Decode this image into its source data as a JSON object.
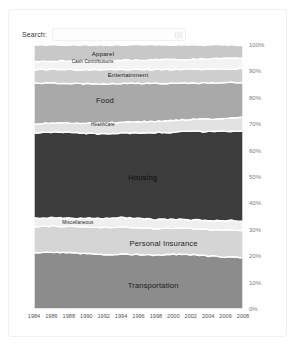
{
  "search": {
    "label": "Search:",
    "value": "",
    "placeholder": "",
    "clear_icon": "clear-icon"
  },
  "chart_data": {
    "type": "area",
    "title": "",
    "subtitle": "",
    "xlabel": "",
    "ylabel": "",
    "stacked": "100%",
    "grid": false,
    "legend_position": "inline-labels",
    "x": [
      1984,
      1986,
      1988,
      1990,
      1992,
      1994,
      1996,
      1998,
      2000,
      2002,
      2004,
      2006,
      2008
    ],
    "xtick_labels": [
      "1984",
      "1986",
      "1988",
      "1990",
      "1992",
      "1994",
      "1996",
      "1998",
      "2000",
      "2002",
      "2004",
      "2006",
      "2008"
    ],
    "ytick_labels": [
      "100%",
      "90%",
      "80%",
      "70%",
      "60%",
      "50%",
      "40%",
      "30%",
      "20%",
      "10%",
      "0%"
    ],
    "ylim": [
      0,
      100
    ],
    "series": [
      {
        "name": "Transportation",
        "color": "#8c8c8c",
        "label_x_pct": 57,
        "label_y_pct": 9,
        "values": [
          20.3,
          20.8,
          20.6,
          20.0,
          19.4,
          19.8,
          19.6,
          19.4,
          19.8,
          19.8,
          19.3,
          19.0,
          18.8
        ]
      },
      {
        "name": "Personal Insurance",
        "color": "#d5d5d5",
        "label_x_pct": 62,
        "label_y_pct": 25,
        "values": [
          9.8,
          9.6,
          9.6,
          9.6,
          9.9,
          9.8,
          9.7,
          9.6,
          9.4,
          9.4,
          9.6,
          9.8,
          10.0
        ]
      },
      {
        "name": "Miscellaneous",
        "color": "#efefef",
        "label_x_pct": 21,
        "label_y_pct": 33,
        "values": [
          3.0,
          3.1,
          3.1,
          3.2,
          3.3,
          3.4,
          3.4,
          3.3,
          3.2,
          3.2,
          3.3,
          3.4,
          3.5
        ]
      },
      {
        "name": "Housing",
        "color": "#3c3c3c",
        "label_x_pct": 52,
        "label_y_pct": 50,
        "values": [
          31.0,
          31.5,
          31.2,
          30.7,
          30.3,
          30.4,
          30.8,
          31.4,
          31.6,
          32.2,
          32.3,
          32.6,
          32.8
        ]
      },
      {
        "name": "Healthcare",
        "color": "#e2e2e2",
        "label_x_pct": 33,
        "label_y_pct": 70,
        "values": [
          3.2,
          3.4,
          3.5,
          3.6,
          3.8,
          3.9,
          4.0,
          4.1,
          4.2,
          4.4,
          4.6,
          4.7,
          4.8
        ]
      },
      {
        "name": "Food",
        "color": "#a9a9a9",
        "label_x_pct": 34,
        "label_y_pct": 79,
        "values": [
          14.8,
          14.6,
          14.4,
          14.3,
          14.2,
          14.1,
          13.9,
          13.6,
          13.4,
          13.2,
          13.1,
          13.0,
          12.9
        ]
      },
      {
        "name": "Entertainment",
        "color": "#cfcfcf",
        "label_x_pct": 45,
        "label_y_pct": 89,
        "values": [
          5.0,
          5.0,
          5.1,
          5.1,
          5.0,
          5.0,
          5.0,
          5.1,
          5.1,
          5.0,
          5.0,
          5.0,
          5.0
        ]
      },
      {
        "name": "Cash Contributions",
        "color": "#f3f3f3",
        "label_x_pct": 28,
        "label_y_pct": 94,
        "values": [
          3.0,
          3.0,
          3.1,
          3.2,
          3.3,
          3.3,
          3.4,
          3.5,
          3.6,
          3.7,
          3.8,
          3.8,
          3.8
        ]
      },
      {
        "name": "Apparel",
        "color": "#c8c8c8",
        "label_x_pct": 33,
        "label_y_pct": 97,
        "values": [
          6.0,
          5.9,
          5.8,
          5.7,
          5.6,
          5.5,
          5.4,
          5.3,
          5.2,
          5.1,
          5.0,
          4.9,
          4.8
        ]
      }
    ]
  }
}
